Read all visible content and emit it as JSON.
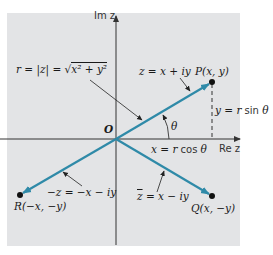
{
  "diagram": {
    "type": "complex-plane",
    "colors": {
      "background": "#ffffff",
      "panel": "#e3e4e6",
      "vector": "#2f8aa8",
      "axis": "#333333",
      "text": "#1a1a1a"
    },
    "axes": {
      "imaginary_label": "Im z",
      "real_label": "Re z"
    },
    "origin": {
      "label": "O",
      "x": 116,
      "y": 139
    },
    "points": [
      {
        "id": "P",
        "label": "P(x, y)",
        "x": 212,
        "y": 82
      },
      {
        "id": "Q",
        "label": "Q(x, −y)",
        "x": 212,
        "y": 196
      },
      {
        "id": "R",
        "label": "R(−x, −y)",
        "x": 20,
        "y": 195
      }
    ],
    "vectors": [
      {
        "from": "O",
        "to": "P",
        "label": "z = x + iy"
      },
      {
        "from": "O",
        "to": "Q",
        "label": "z̄ = x − iy",
        "label_base": "z",
        "label_rest": " = x − iy"
      },
      {
        "from": "O",
        "to": "R",
        "label": "−z = −x − iy"
      }
    ],
    "annotations": {
      "modulus": "r = |z| = √(x² + y²)",
      "modulus_parts": {
        "lhs": "r = ",
        "abs": "|z|",
        "eq": " = √",
        "rad": "x² + y²"
      },
      "angle": "θ",
      "y_component": "y = r sin θ",
      "y_component_parts": {
        "var": "y = r",
        "fn": " sin ",
        "ang": "θ"
      },
      "x_component": "x = r cos θ",
      "x_component_parts": {
        "var": "x = r",
        "fn": " cos ",
        "ang": "θ"
      }
    }
  }
}
